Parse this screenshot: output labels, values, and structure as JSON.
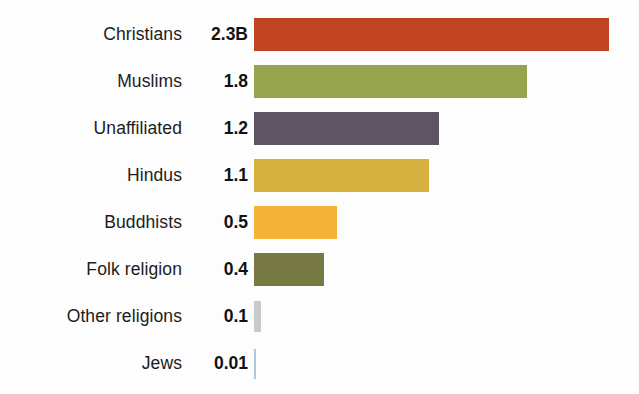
{
  "chart_data": {
    "type": "bar",
    "title": "",
    "subtitle": "",
    "xlabel": "",
    "ylabel": "",
    "orientation": "horizontal",
    "grid": false,
    "legend": "none",
    "unit_note": "B",
    "xlim": [
      0,
      2.3
    ],
    "categories": [
      "Christians",
      "Muslims",
      "Unaffiliated",
      "Hindus",
      "Buddhists",
      "Folk religion",
      "Other religions",
      "Jews"
    ],
    "values": [
      2.3,
      1.8,
      1.2,
      1.1,
      0.5,
      0.4,
      0.1,
      0.01
    ],
    "value_labels": [
      "2.3B",
      "1.8",
      "1.2",
      "1.1",
      "0.5",
      "0.4",
      "0.1",
      "0.01"
    ],
    "colors": [
      "#c0441f",
      "#96a44e",
      "#5d5563",
      "#d7b13f",
      "#f5b335",
      "#767a42",
      "#c9c9c9",
      "#a8cbe0"
    ],
    "bar_pixel_widths": [
      355,
      273,
      185,
      175,
      83,
      70,
      7,
      2
    ]
  },
  "rows": [
    {
      "label": "Christians",
      "value": "2.3B",
      "color": "#c0441f",
      "width": 355
    },
    {
      "label": "Muslims",
      "value": "1.8",
      "color": "#96a44e",
      "width": 273
    },
    {
      "label": "Unaffiliated",
      "value": "1.2",
      "color": "#5d5563",
      "width": 185
    },
    {
      "label": "Hindus",
      "value": "1.1",
      "color": "#d7b13f",
      "width": 175
    },
    {
      "label": "Buddhists",
      "value": "0.5",
      "color": "#f5b335",
      "width": 83
    },
    {
      "label": "Folk religion",
      "value": "0.4",
      "color": "#767a42",
      "width": 70
    },
    {
      "label": "Other religions",
      "value": "0.1",
      "color": "#c9c9c9",
      "width": 7
    },
    {
      "label": "Jews",
      "value": "0.01",
      "color": "#a8cbe0",
      "width": 2
    }
  ]
}
